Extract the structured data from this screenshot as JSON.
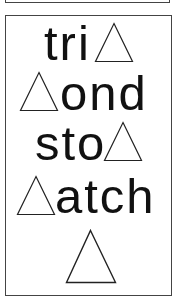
{
  "card": {
    "rows": [
      {
        "text": "tri",
        "triangle_position": "after"
      },
      {
        "text": "ond",
        "triangle_position": "before"
      },
      {
        "text": "sto",
        "triangle_position": "after"
      },
      {
        "text": "atch",
        "triangle_position": "before"
      },
      {
        "text": "",
        "triangle_position": "alone"
      }
    ],
    "symbol": "triangle-icon",
    "colors": {
      "text": "#111111",
      "border": "#444444",
      "background": "#ffffff"
    }
  }
}
